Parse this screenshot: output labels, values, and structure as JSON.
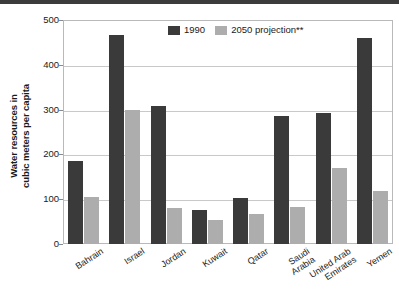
{
  "figure": {
    "top_rule_color": "#3b3b3b",
    "frame_color": "#b9b9b9"
  },
  "chart_data": {
    "type": "bar",
    "title": "",
    "xlabel": "",
    "ylabel": "Water resources in cubic meters per capita",
    "ylabel_line1": "Water resources in",
    "ylabel_line2": "cubic meters per capita",
    "ylim": [
      0,
      500
    ],
    "yticks": [
      0,
      100,
      200,
      300,
      400,
      500
    ],
    "ytick_labels": [
      "0",
      "100",
      "200",
      "300",
      "400",
      "500"
    ],
    "grid": true,
    "legend_position": "top-center",
    "categories": [
      "Bahrain",
      "Israel",
      "Jordan",
      "Kuwait",
      "Qatar",
      "Saudi Arabia",
      "United Arab Emirates",
      "Yemen"
    ],
    "category_lines": [
      [
        "Bahrain"
      ],
      [
        "Israel"
      ],
      [
        "Jordan"
      ],
      [
        "Kuwait"
      ],
      [
        "Qatar"
      ],
      [
        "Saudi",
        "Arabia"
      ],
      [
        "United Arab",
        "Emirates"
      ],
      [
        "Yemen"
      ]
    ],
    "series": [
      {
        "name": "1990",
        "color": "#3a3a3a",
        "values": [
          185,
          466,
          307,
          77,
          103,
          285,
          293,
          459
        ]
      },
      {
        "name": "2050 projection**",
        "color": "#adadad",
        "values": [
          105,
          300,
          80,
          53,
          67,
          83,
          170,
          118
        ]
      }
    ]
  },
  "legend": {
    "items": [
      {
        "label": "1990",
        "swatch": "dark"
      },
      {
        "label": "2050 projection**",
        "swatch": "light"
      }
    ]
  }
}
